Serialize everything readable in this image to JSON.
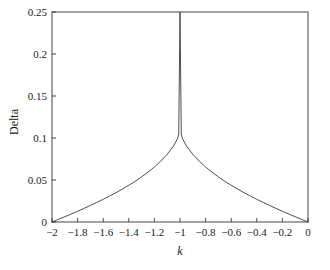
{
  "chart_data": {
    "type": "line",
    "title": "",
    "xlabel": "k",
    "ylabel": "Delta",
    "xlim": [
      -2,
      0
    ],
    "ylim": [
      0,
      0.25
    ],
    "grid": false,
    "legend": null,
    "xticks": [
      -2,
      -1.8,
      -1.6,
      -1.4,
      -1.2,
      -1,
      -0.8,
      -0.6,
      -0.4,
      -0.2,
      0
    ],
    "xticklabels": [
      "-2",
      "-1.8",
      "-1.6",
      "-1.4",
      "-1.2",
      "-1",
      "-0.8",
      "-0.6",
      "-0.4",
      "-0.2",
      "0"
    ],
    "yticks": [
      0,
      0.05,
      0.1,
      0.15,
      0.2,
      0.25
    ],
    "yticklabels": [
      "0",
      "0.05",
      "0.1",
      "0.15",
      "0.2",
      "0.25"
    ],
    "series": [
      {
        "name": "Delta",
        "color": "#3a3a3a",
        "linewidth": 0.9,
        "x": [
          -2,
          -1.95,
          -1.9,
          -1.85,
          -1.8,
          -1.75,
          -1.7,
          -1.65,
          -1.6,
          -1.55,
          -1.5,
          -1.45,
          -1.4,
          -1.35,
          -1.3,
          -1.25,
          -1.2,
          -1.15,
          -1.1,
          -1.05,
          -1.02,
          -1.01,
          -1,
          -0.99,
          -0.98,
          -0.95,
          -0.9,
          -0.85,
          -0.8,
          -0.75,
          -0.7,
          -0.65,
          -0.6,
          -0.55,
          -0.5,
          -0.45,
          -0.4,
          -0.35,
          -0.3,
          -0.25,
          -0.2,
          -0.15,
          -0.1,
          -0.05,
          0
        ],
        "y": [
          0,
          0.0031,
          0.0063,
          0.0095,
          0.0128,
          0.0162,
          0.0197,
          0.0233,
          0.027,
          0.0309,
          0.0349,
          0.0392,
          0.0437,
          0.0485,
          0.0537,
          0.0593,
          0.0655,
          0.0725,
          0.0806,
          0.0906,
          0.0989,
          0.1046,
          0.25,
          0.1046,
          0.0989,
          0.0906,
          0.0806,
          0.0725,
          0.0655,
          0.0593,
          0.0537,
          0.0485,
          0.0437,
          0.0392,
          0.0349,
          0.0309,
          0.027,
          0.0233,
          0.0197,
          0.0162,
          0.0128,
          0.0095,
          0.0063,
          0.0031,
          0
        ]
      }
    ],
    "annotations": []
  },
  "axes": {
    "x_title": "k",
    "y_title": "Delta"
  }
}
